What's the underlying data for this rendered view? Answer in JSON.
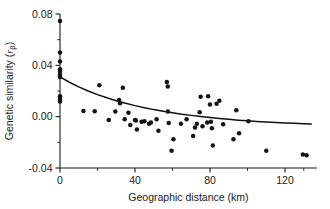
{
  "chart_data": {
    "type": "scatter",
    "title": "",
    "xlabel": "Geographic distance (km)",
    "ylabel_main": "Genetic similarity (",
    "ylabel_symbol": "r",
    "ylabel_subscript": "β",
    "ylabel_close": ")",
    "ylabel_full": "Genetic similarity (rβ)",
    "xlim": [
      -6,
      137
    ],
    "ylim": [
      -0.04,
      0.08
    ],
    "xticks": [
      0,
      40,
      80,
      120
    ],
    "xticklabels": [
      "0",
      "40",
      "80",
      "120"
    ],
    "xminorticks": [
      20,
      60,
      100
    ],
    "yticks": [
      -0.04,
      0.0,
      0.04,
      0.08
    ],
    "yticklabels": [
      "-0.04",
      "0.00",
      "0.04",
      "0.08"
    ],
    "yminorticks": [
      -0.02,
      0.02,
      0.06
    ],
    "grid": false,
    "legend": "none",
    "marker": "filled-circle",
    "marker_color": "#141414",
    "marker_size_px": 3.4,
    "points": [
      {
        "x": 0.0,
        "y": 0.0745
      },
      {
        "x": 0.0,
        "y": 0.05
      },
      {
        "x": 0.0,
        "y": 0.043
      },
      {
        "x": 0.0,
        "y": 0.037
      },
      {
        "x": 0.0,
        "y": 0.035
      },
      {
        "x": 0.0,
        "y": 0.0325
      },
      {
        "x": 0.0,
        "y": 0.031
      },
      {
        "x": 0.0,
        "y": 0.016
      },
      {
        "x": 0.0,
        "y": 0.0145
      },
      {
        "x": 0.0,
        "y": 0.013
      },
      {
        "x": 0.0,
        "y": 0.0118
      },
      {
        "x": 12.5,
        "y": 0.0045
      },
      {
        "x": 18.5,
        "y": 0.0042
      },
      {
        "x": 21.0,
        "y": 0.0245
      },
      {
        "x": 26.0,
        "y": -0.0025
      },
      {
        "x": 29.5,
        "y": 0.004
      },
      {
        "x": 31.5,
        "y": 0.013
      },
      {
        "x": 32.0,
        "y": 0.0105
      },
      {
        "x": 33.5,
        "y": 0.0225
      },
      {
        "x": 34.5,
        "y": -0.002
      },
      {
        "x": 36.5,
        "y": 0.003
      },
      {
        "x": 37.5,
        "y": -0.0065
      },
      {
        "x": 40.0,
        "y": -0.0025
      },
      {
        "x": 40.5,
        "y": -0.003
      },
      {
        "x": 41.0,
        "y": -0.01
      },
      {
        "x": 43.5,
        "y": -0.004
      },
      {
        "x": 45.0,
        "y": -0.0035
      },
      {
        "x": 47.5,
        "y": -0.0055
      },
      {
        "x": 48.5,
        "y": -0.0045
      },
      {
        "x": 51.5,
        "y": -0.002
      },
      {
        "x": 52.5,
        "y": -0.011
      },
      {
        "x": 57.0,
        "y": 0.027
      },
      {
        "x": 57.5,
        "y": 0.0235
      },
      {
        "x": 57.5,
        "y": 0.004
      },
      {
        "x": 58.0,
        "y": -0.005
      },
      {
        "x": 59.5,
        "y": -0.0265
      },
      {
        "x": 60.5,
        "y": -0.0175
      },
      {
        "x": 64.5,
        "y": -0.0055
      },
      {
        "x": 67.5,
        "y": -0.002
      },
      {
        "x": 71.0,
        "y": -0.015
      },
      {
        "x": 72.0,
        "y": -0.0085
      },
      {
        "x": 73.0,
        "y": -0.0055
      },
      {
        "x": 74.5,
        "y": 0.0035
      },
      {
        "x": 75.0,
        "y": 0.0155
      },
      {
        "x": 76.0,
        "y": -0.0075
      },
      {
        "x": 78.5,
        "y": -0.0045
      },
      {
        "x": 79.0,
        "y": 0.016
      },
      {
        "x": 80.0,
        "y": 0.0095
      },
      {
        "x": 80.5,
        "y": -0.004
      },
      {
        "x": 81.0,
        "y": -0.009
      },
      {
        "x": 81.5,
        "y": -0.0225
      },
      {
        "x": 83.5,
        "y": 0.01
      },
      {
        "x": 85.0,
        "y": 0.0125
      },
      {
        "x": 87.0,
        "y": -0.006
      },
      {
        "x": 92.5,
        "y": -0.0175
      },
      {
        "x": 94.0,
        "y": 0.005
      },
      {
        "x": 95.5,
        "y": -0.013
      },
      {
        "x": 100.5,
        "y": -0.0035
      },
      {
        "x": 110.0,
        "y": -0.0265
      },
      {
        "x": 129.5,
        "y": -0.0295
      },
      {
        "x": 131.5,
        "y": -0.03
      }
    ],
    "fit_curve": {
      "description": "negative exponential decay fit",
      "points": [
        {
          "x": 0,
          "y": 0.031
        },
        {
          "x": 5,
          "y": 0.0268
        },
        {
          "x": 10,
          "y": 0.0232
        },
        {
          "x": 15,
          "y": 0.02
        },
        {
          "x": 20,
          "y": 0.0172
        },
        {
          "x": 25,
          "y": 0.0147
        },
        {
          "x": 30,
          "y": 0.0124
        },
        {
          "x": 35,
          "y": 0.0104
        },
        {
          "x": 40,
          "y": 0.0086
        },
        {
          "x": 45,
          "y": 0.007
        },
        {
          "x": 50,
          "y": 0.0055
        },
        {
          "x": 55,
          "y": 0.0042
        },
        {
          "x": 60,
          "y": 0.003
        },
        {
          "x": 65,
          "y": 0.0019
        },
        {
          "x": 70,
          "y": 0.001
        },
        {
          "x": 75,
          "y": 0.0001
        },
        {
          "x": 80,
          "y": -0.0007
        },
        {
          "x": 85,
          "y": -0.0014
        },
        {
          "x": 90,
          "y": -0.0021
        },
        {
          "x": 95,
          "y": -0.0027
        },
        {
          "x": 100,
          "y": -0.0032
        },
        {
          "x": 105,
          "y": -0.0037
        },
        {
          "x": 110,
          "y": -0.0041
        },
        {
          "x": 115,
          "y": -0.0045
        },
        {
          "x": 120,
          "y": -0.0049
        },
        {
          "x": 125,
          "y": -0.0052
        },
        {
          "x": 130,
          "y": -0.0055
        },
        {
          "x": 134,
          "y": -0.0057
        }
      ]
    }
  }
}
